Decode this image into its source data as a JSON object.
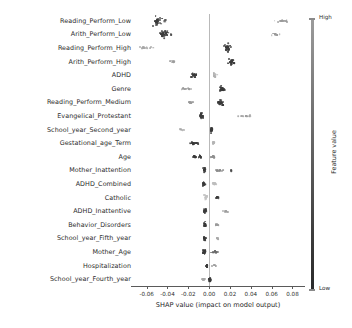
{
  "chart_data": {
    "type": "scatter",
    "plot_kind": "shap-beeswarm-summary",
    "title": "",
    "xlabel": "SHAP value (impact on model output)",
    "ylabel": "",
    "xlim": [
      -0.075,
      0.092
    ],
    "xticks": [
      -0.06,
      -0.04,
      -0.02,
      0.0,
      0.02,
      0.04,
      0.06,
      0.08
    ],
    "xticklabels": [
      "-0.06",
      "-0.04",
      "-0.02",
      "0.00",
      "0.02",
      "0.04",
      "0.06",
      "0.08"
    ],
    "grid": false,
    "zero_reference_line": 0.0,
    "colorbar": {
      "title": "Feature value",
      "high_label": "High",
      "low_label": "Low",
      "high_color": "#9c9c9c",
      "low_color": "#2a2a2a",
      "position": "right"
    },
    "categories": [
      "Reading_Perform_Low",
      "Arith_Perform_Low",
      "Reading_Perform_High",
      "Arith_Perform_High",
      "ADHD",
      "Genre",
      "Reading_Perform_Medium",
      "Evangelical_Protestant",
      "School_year_Second_year",
      "Gestational_age_Term",
      "Age",
      "Mother_Inattention",
      "ADHD_Combined",
      "Catholic",
      "ADHD_Inattentive",
      "Behavior_Disorders",
      "School_year_Fifth_year",
      "Mother_Age",
      "Hospitalization",
      "School_year_Fourth_year"
    ],
    "series": [
      {
        "name": "Reading_Perform_Low",
        "clusters": [
          {
            "center": -0.049,
            "spread": 0.0045,
            "n": 34,
            "color": "#3a3a3a",
            "ry": 5.2
          },
          {
            "center": -0.0425,
            "spread": 0.0012,
            "n": 5,
            "color": "#4a4a4a",
            "ry": 1.2
          },
          {
            "center": 0.0705,
            "spread": 0.0075,
            "n": 16,
            "color": "#9a9a9a",
            "ry": 1.4
          }
        ]
      },
      {
        "name": "Arith_Perform_Low",
        "clusters": [
          {
            "center": -0.0435,
            "spread": 0.0042,
            "n": 30,
            "color": "#3a3a3a",
            "ry": 4.0
          },
          {
            "center": -0.0365,
            "spread": 0.001,
            "n": 4,
            "color": "#4a4a4a",
            "ry": 1.0
          },
          {
            "center": 0.0645,
            "spread": 0.0065,
            "n": 13,
            "color": "#9a9a9a",
            "ry": 1.1
          }
        ]
      },
      {
        "name": "Reading_Perform_High",
        "clusters": [
          {
            "center": -0.0615,
            "spread": 0.0085,
            "n": 12,
            "color": "#a5a5a5",
            "ry": 1.0
          },
          {
            "center": 0.0175,
            "spread": 0.004,
            "n": 30,
            "color": "#3a3a3a",
            "ry": 4.4
          }
        ]
      },
      {
        "name": "Arith_Perform_High",
        "clusters": [
          {
            "center": -0.0355,
            "spread": 0.0035,
            "n": 10,
            "color": "#9e9e9e",
            "ry": 1.0
          },
          {
            "center": 0.0215,
            "spread": 0.0038,
            "n": 32,
            "color": "#3a3a3a",
            "ry": 4.6
          }
        ]
      },
      {
        "name": "ADHD",
        "clusters": [
          {
            "center": -0.0145,
            "spread": 0.0028,
            "n": 22,
            "color": "#3a3a3a",
            "ry": 1.9
          },
          {
            "center": 0.0055,
            "spread": 0.0022,
            "n": 16,
            "color": "#b0b0b0",
            "ry": 3.0
          }
        ]
      },
      {
        "name": "Genre",
        "clusters": [
          {
            "center": -0.0225,
            "spread": 0.006,
            "n": 14,
            "color": "#9a9a9a",
            "ry": 1.0
          },
          {
            "center": 0.0125,
            "spread": 0.0032,
            "n": 28,
            "color": "#3a3a3a",
            "ry": 3.6
          }
        ]
      },
      {
        "name": "Reading_Perform_Medium",
        "clusters": [
          {
            "center": -0.0175,
            "spread": 0.0022,
            "n": 12,
            "color": "#9a9a9a",
            "ry": 1.0
          },
          {
            "center": 0.011,
            "spread": 0.003,
            "n": 28,
            "color": "#3a3a3a",
            "ry": 3.8
          }
        ]
      },
      {
        "name": "Evangelical_Protestant",
        "clusters": [
          {
            "center": -0.0072,
            "spread": 0.002,
            "n": 24,
            "color": "#3c3c3c",
            "ry": 3.0
          },
          {
            "center": 0.0345,
            "spread": 0.0115,
            "n": 14,
            "color": "#9e9e9e",
            "ry": 0.9
          }
        ]
      },
      {
        "name": "School_year_Second_year",
        "clusters": [
          {
            "center": -0.0265,
            "spread": 0.0055,
            "n": 8,
            "color": "#a8a8a8",
            "ry": 0.9
          },
          {
            "center": 0.0023,
            "spread": 0.0012,
            "n": 22,
            "color": "#3a3a3a",
            "ry": 3.2
          }
        ]
      },
      {
        "name": "Gestational_age_Term",
        "clusters": [
          {
            "center": -0.0145,
            "spread": 0.0055,
            "n": 22,
            "color": "#3a3a3a",
            "ry": 1.1
          },
          {
            "center": 0.0042,
            "spread": 0.0014,
            "n": 14,
            "color": "#b4b4b4",
            "ry": 2.6
          }
        ]
      },
      {
        "name": "Age",
        "clusters": [
          {
            "center": -0.014,
            "spread": 0.0016,
            "n": 14,
            "color": "#3a3a3a",
            "ry": 1.8
          },
          {
            "center": -0.0088,
            "spread": 0.0014,
            "n": 13,
            "color": "#3a3a3a",
            "ry": 1.8
          },
          {
            "center": 0.0035,
            "spread": 0.002,
            "n": 14,
            "color": "#8f8f8f",
            "ry": 2.4
          }
        ]
      },
      {
        "name": "Mother_Inattention",
        "clusters": [
          {
            "center": -0.0048,
            "spread": 0.0012,
            "n": 20,
            "color": "#3a3a3a",
            "ry": 2.8
          },
          {
            "center": 0.0105,
            "spread": 0.005,
            "n": 12,
            "color": "#8a8a8a",
            "ry": 0.9
          },
          {
            "center": 0.0215,
            "spread": 0.0012,
            "n": 4,
            "color": "#4a4a4a",
            "ry": 0.8
          }
        ]
      },
      {
        "name": "ADHD_Combined",
        "clusters": [
          {
            "center": -0.0052,
            "spread": 0.0018,
            "n": 24,
            "color": "#3a3a3a",
            "ry": 3.0
          },
          {
            "center": 0.005,
            "spread": 0.0018,
            "n": 12,
            "color": "#bdbdbd",
            "ry": 2.2
          }
        ]
      },
      {
        "name": "Catholic",
        "clusters": [
          {
            "center": -0.0032,
            "spread": 0.0012,
            "n": 14,
            "color": "#c2c2c2",
            "ry": 2.6
          },
          {
            "center": 0.0082,
            "spread": 0.0016,
            "n": 12,
            "color": "#3a3a3a",
            "ry": 1.2
          }
        ]
      },
      {
        "name": "ADHD_Inattentive",
        "clusters": [
          {
            "center": -0.004,
            "spread": 0.0012,
            "n": 20,
            "color": "#3a3a3a",
            "ry": 2.8
          },
          {
            "center": 0.015,
            "spread": 0.0032,
            "n": 8,
            "color": "#9e9e9e",
            "ry": 0.8
          }
        ]
      },
      {
        "name": "Behavior_Disorders",
        "clusters": [
          {
            "center": -0.0038,
            "spread": 0.0014,
            "n": 20,
            "color": "#3a3a3a",
            "ry": 2.6
          },
          {
            "center": 0.0075,
            "spread": 0.003,
            "n": 9,
            "color": "#9a9a9a",
            "ry": 0.8
          }
        ]
      },
      {
        "name": "School_year_Fifth_year",
        "clusters": [
          {
            "center": -0.0042,
            "spread": 0.0013,
            "n": 20,
            "color": "#3a3a3a",
            "ry": 2.8
          },
          {
            "center": 0.008,
            "spread": 0.0012,
            "n": 6,
            "color": "#a8a8a8",
            "ry": 0.8
          }
        ]
      },
      {
        "name": "Mother_Age",
        "clusters": [
          {
            "center": -0.0045,
            "spread": 0.0016,
            "n": 20,
            "color": "#3a3a3a",
            "ry": 2.6
          },
          {
            "center": 0.0055,
            "spread": 0.003,
            "n": 16,
            "color": "#6a6a6a",
            "ry": 1.1
          }
        ]
      },
      {
        "name": "Hospitalization",
        "clusters": [
          {
            "center": -0.0022,
            "spread": 0.0011,
            "n": 16,
            "color": "#3a3a3a",
            "ry": 2.2
          },
          {
            "center": 0.0055,
            "spread": 0.0022,
            "n": 8,
            "color": "#a0a0a0",
            "ry": 0.6
          }
        ]
      },
      {
        "name": "School_year_Fourth_year",
        "clusters": [
          {
            "center": -0.0055,
            "spread": 0.0018,
            "n": 8,
            "color": "#a8a8a8",
            "ry": 0.8
          },
          {
            "center": 0.0008,
            "spread": 0.0012,
            "n": 18,
            "color": "#3a3a3a",
            "ry": 2.4
          }
        ]
      }
    ]
  }
}
